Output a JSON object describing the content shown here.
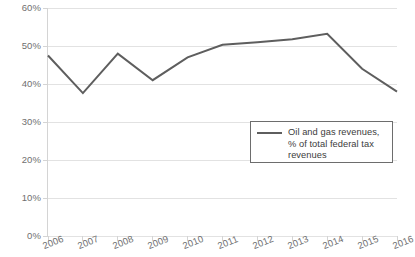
{
  "chart_data": {
    "type": "line",
    "title": "",
    "xlabel": "",
    "ylabel": "",
    "categories": [
      "2006",
      "2007",
      "2008",
      "2009",
      "2010",
      "2011",
      "2012",
      "2013",
      "2014",
      "2015",
      "2016"
    ],
    "series": [
      {
        "name": "Oil and gas revenues, % of total federal tax revenues",
        "values": [
          47.5,
          37.6,
          48.0,
          41.0,
          47.0,
          50.3,
          51.0,
          51.8,
          53.2,
          44.0,
          38.0
        ]
      }
    ],
    "ylim": [
      0,
      60
    ],
    "yticks": [
      0,
      10,
      20,
      30,
      40,
      50,
      60
    ],
    "ytick_labels": [
      "0%",
      "10%",
      "20%",
      "30%",
      "40%",
      "50%",
      "60%"
    ],
    "grid": true,
    "legend_position": "inside-bottom-right",
    "line_color": "#5e5e5e",
    "grid_color": "#e2e2e2",
    "axis_color": "#d4d4d4",
    "tick_label_color": "#6f6f6f"
  },
  "legend": {
    "entries": [
      {
        "label": "Oil and gas revenues, % of total federal tax revenues",
        "swatch": "line-swatch"
      }
    ]
  }
}
